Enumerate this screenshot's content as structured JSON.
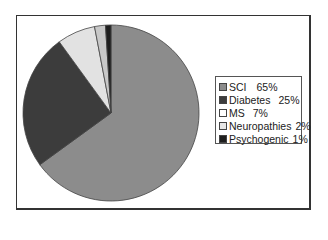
{
  "chart_data": {
    "type": "pie",
    "title": "",
    "categories": [
      "SCI",
      "Diabetes",
      "MS",
      "Neuropathies",
      "Psychogenic"
    ],
    "values": [
      65,
      25,
      7,
      2,
      1
    ],
    "colors": [
      "#8c8c8c",
      "#3c3c3c",
      "#e2e2e2",
      "#c8c8c8",
      "#1e1e1e"
    ],
    "legend_position": "right",
    "start_angle_deg": 0,
    "direction": "clockwise"
  },
  "legend": {
    "items": [
      {
        "label": "SCI",
        "pct": "65%"
      },
      {
        "label": "Diabetes",
        "pct": "25%"
      },
      {
        "label": "MS",
        "pct": "7%"
      },
      {
        "label": "Neuropathies",
        "pct": "2%"
      },
      {
        "label": "Psychogenic",
        "pct": "1%"
      }
    ]
  }
}
